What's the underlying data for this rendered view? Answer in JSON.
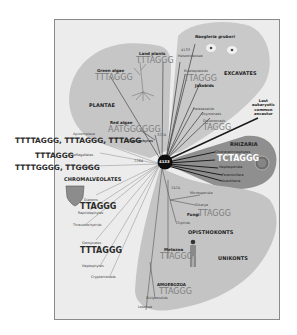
{
  "diagram": {
    "root": {
      "label": "4133",
      "description": "Last eukaryotic common ancestor"
    },
    "lca_label": "Last\neukaryotic\ncommon\nancestor",
    "node_labels": {
      "plantae_node": "3224",
      "chromalveolates_node": "2264",
      "opisthokonts_node": "2424",
      "excavates_node": "4133",
      "amoebozoa_node": "2"
    },
    "groups": {
      "plantae": {
        "label": "PLANTAE",
        "land_plants": {
          "name": "Land plants",
          "seq": "TTTAGGG"
        },
        "green_algae": {
          "name": "Green algae",
          "seq": "TTTAGGG"
        },
        "red_algae": {
          "name": "Red algae",
          "seq": "AATGGGGGG"
        },
        "glaucophytes": "Glaucophytes"
      },
      "excavates": {
        "label": "EXCAVATES",
        "naegleria": "Naegleria gruberi",
        "heterolobosea": "Heterolobosea",
        "kinetoplastids": {
          "name": "Kinetoplastids",
          "seq": "TTAGGG"
        },
        "jakobids": "Jakobids",
        "parabasalids": "Parabasalids",
        "oxymonads": "Oxymonads",
        "diplomonads": {
          "name": "Diplomonads",
          "seq": "TAGGG"
        }
      },
      "rhizaria": {
        "label": "RHIZARIA",
        "seq": "TCTAGGG",
        "members": [
          "Chlorarachniophytes",
          "Haplosporidia",
          "Foraminifera",
          "Acantharia"
        ]
      },
      "chromalveolates": {
        "label": "CHROMALVEOLATES",
        "apicomplexa": {
          "name": "Apicomplexa",
          "seq": "TTTTAGGG, TTTAGGG, TTTAGG"
        },
        "dinoflagellates": {
          "name": "Dinoflagellates",
          "seq": "TTTAGGG"
        },
        "ciliates": {
          "name": "Ciliates",
          "seq": "TTTTGGGG, TTGGGG"
        },
        "diatoms": {
          "name": "Diatoms",
          "seq": "TTAGGG"
        },
        "raphidophytes": "Raphidophytes",
        "thraustochytrids": "Thraustochytrids",
        "oomycetes": {
          "name": "Oomycetes",
          "seq": "TTTAGGG"
        },
        "haptophytes": "Haptophytes",
        "cryptomonads": "Cryptomonads"
      },
      "opisthokonts": {
        "label": "OPISTHOKONTS",
        "microsporidia": "Microsporidia",
        "dikarya": "Dikarya",
        "fungi": {
          "name": "Fungi",
          "seq": "TTAGGG"
        },
        "chytrids": "Chytrids",
        "metazoa": {
          "name": "Metazoa",
          "seq": "TTAGGG"
        }
      },
      "unikonts": {
        "label": "UNIKONTS"
      },
      "amoebozoa": {
        "label": "AMOEBOZOA",
        "seq": "TTAGGG",
        "dictyostelids": "Dictyostelids",
        "lobosea": "Lobosea"
      }
    },
    "colors": {
      "blob": "#c4c4c4",
      "blob_dark": "#9a9a9a",
      "rhizaria": "#8e8e8e",
      "frame_bg": "#ececec",
      "root": "#0e0e0e"
    }
  }
}
